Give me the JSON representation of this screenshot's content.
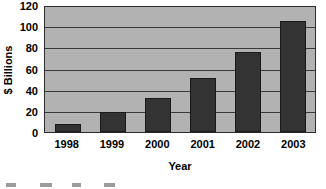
{
  "chart_data": {
    "type": "bar",
    "title": "",
    "xlabel": "Year",
    "ylabel": "$ Billions",
    "categories": [
      "1998",
      "1999",
      "2000",
      "2001",
      "2002",
      "2003"
    ],
    "values": [
      8,
      19,
      33,
      52,
      77,
      107
    ],
    "ylim": [
      0,
      120
    ],
    "ytick_values": [
      0,
      20,
      40,
      60,
      80,
      100,
      120
    ],
    "ytick_labels": [
      "0",
      "20",
      "40",
      "60",
      "80",
      "100",
      "120"
    ],
    "grid": true,
    "grid_axis": "y",
    "legend": false,
    "legend_position": "none",
    "bar_color": "#333333",
    "plot_background": "#b2b2b2",
    "axis_color": "#2b2b2b",
    "gridline_color": "#3a3a3a",
    "page_background": "#ffffff",
    "text_color": "#000000"
  },
  "axes": {
    "y": {
      "title": "$ Billions",
      "ticks": [
        "0",
        "20",
        "40",
        "60",
        "80",
        "100",
        "120"
      ],
      "min": 0,
      "max": 120
    },
    "x": {
      "title": "Year",
      "ticks": [
        "1998",
        "1999",
        "2000",
        "2001",
        "2002",
        "2003"
      ]
    }
  },
  "bars": [
    {
      "category": "1998",
      "value": 8
    },
    {
      "category": "1999",
      "value": 19
    },
    {
      "category": "2000",
      "value": 33
    },
    {
      "category": "2001",
      "value": 52
    },
    {
      "category": "2002",
      "value": 77
    },
    {
      "category": "2003",
      "value": 107
    }
  ]
}
